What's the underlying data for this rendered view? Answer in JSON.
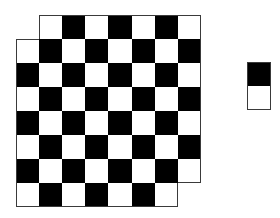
{
  "figure": {
    "board": {
      "rows": 8,
      "cols": 8,
      "origin_x": 16,
      "origin_y": 15,
      "cell_w": 23.1,
      "cell_h": 24,
      "removed_cells": [
        [
          0,
          0
        ],
        [
          7,
          7
        ]
      ],
      "dark_parity": 0,
      "colors": {
        "dark": "#000000",
        "light": "#ffffff",
        "outline": "#3a3a3a"
      }
    },
    "domino": {
      "x": 247,
      "y": 62,
      "w": 24,
      "h": 48,
      "top_color": "#000000",
      "bottom_color": "#ffffff"
    }
  }
}
